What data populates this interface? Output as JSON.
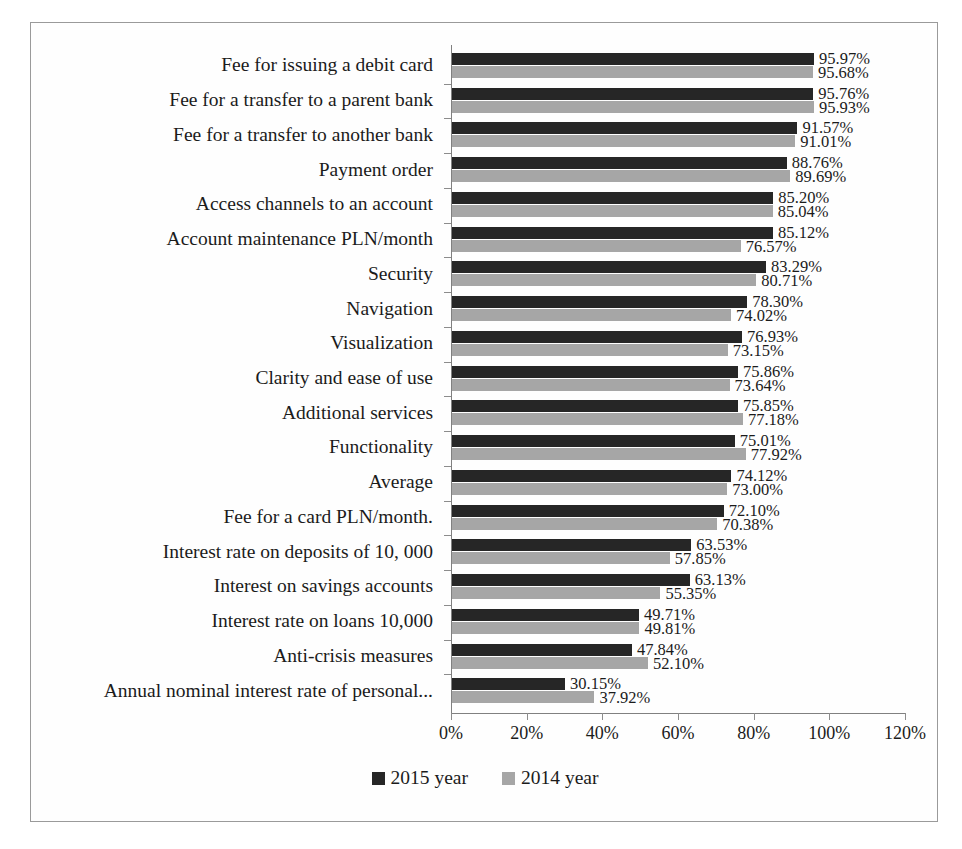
{
  "chart_data": {
    "type": "bar",
    "orientation": "horizontal",
    "title": "",
    "xlabel": "",
    "ylabel": "",
    "xlim": [
      0,
      120
    ],
    "xtick_labels": [
      "0%",
      "20%",
      "40%",
      "60%",
      "80%",
      "100%",
      "120%"
    ],
    "xtick_values": [
      0,
      20,
      40,
      60,
      80,
      100,
      120
    ],
    "grid": false,
    "legend_position": "bottom",
    "value_suffix": "%",
    "categories": [
      "Fee for issuing a debit card",
      "Fee for a transfer to a parent bank",
      "Fee for a transfer to another bank",
      "Payment order",
      "Access channels to an account",
      "Account maintenance PLN/month",
      "Security",
      "Navigation",
      "Visualization",
      "Clarity and ease of use",
      "Additional services",
      "Functionality",
      "Average",
      "Fee for a card PLN/month.",
      "Interest rate on deposits of 10, 000",
      "Interest on savings accounts",
      "Interest rate on loans 10,000",
      "Anti-crisis measures",
      "Annual nominal interest rate of personal..."
    ],
    "series": [
      {
        "name": "2015 year",
        "color": "#262626",
        "values": [
          95.97,
          95.76,
          91.57,
          88.76,
          85.2,
          85.12,
          83.29,
          78.3,
          76.93,
          75.86,
          75.85,
          75.01,
          74.12,
          72.1,
          63.53,
          63.13,
          49.71,
          47.84,
          30.15
        ],
        "labels": [
          "95.97%",
          "95.76%",
          "91.57%",
          "88.76%",
          "85.20%",
          "85.12%",
          "83.29%",
          "78.30%",
          "76.93%",
          "75.86%",
          "75.85%",
          "75.01%",
          "74.12%",
          "72.10%",
          "63.53%",
          "63.13%",
          "49.71%",
          "47.84%",
          "30.15%"
        ]
      },
      {
        "name": "2014 year",
        "color": "#a6a6a6",
        "values": [
          95.68,
          95.93,
          91.01,
          89.69,
          85.04,
          76.57,
          80.71,
          74.02,
          73.15,
          73.64,
          77.18,
          77.92,
          73.0,
          70.38,
          57.85,
          55.35,
          49.81,
          52.1,
          37.92
        ],
        "labels": [
          "95.68%",
          "95.93%",
          "91.01%",
          "89.69%",
          "85.04%",
          "76.57%",
          "80.71%",
          "74.02%",
          "73.15%",
          "73.64%",
          "77.18%",
          "77.92%",
          "73.00%",
          "70.38%",
          "57.85%",
          "55.35%",
          "49.81%",
          "52.10%",
          "37.92%"
        ]
      }
    ]
  },
  "legend": {
    "items": [
      {
        "label": "2015 year",
        "color": "#262626"
      },
      {
        "label": "2014 year",
        "color": "#a6a6a6"
      }
    ]
  }
}
